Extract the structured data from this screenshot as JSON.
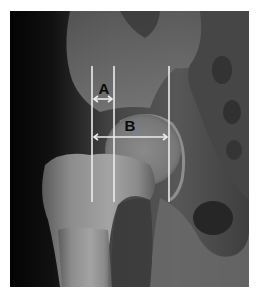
{
  "figure": {
    "type": "radiograph",
    "frame": {
      "left": 10,
      "top": 11,
      "width": 239,
      "height": 276
    },
    "colors": {
      "background": "#ffffff",
      "bone_bright": "#b8b8b8",
      "soft_tissue": "#3a3a3a",
      "dark_field": "#050505",
      "measure_line": "#ececec",
      "label": "#0a0a0a"
    },
    "vertical_lines": [
      {
        "id": "line-1",
        "x": 92,
        "y_top": 66,
        "y_bottom": 202
      },
      {
        "id": "line-2",
        "x": 114,
        "y_top": 66,
        "y_bottom": 202
      },
      {
        "id": "line-3",
        "x": 169,
        "y_top": 66,
        "y_bottom": 202
      }
    ],
    "measurements": [
      {
        "label": "A",
        "x1": 92,
        "x2": 114,
        "arrow_y": 99,
        "label_x": 104,
        "label_y": 94
      },
      {
        "label": "B",
        "x1": 92,
        "x2": 169,
        "arrow_y": 137,
        "label_x": 130,
        "label_y": 131
      }
    ]
  }
}
